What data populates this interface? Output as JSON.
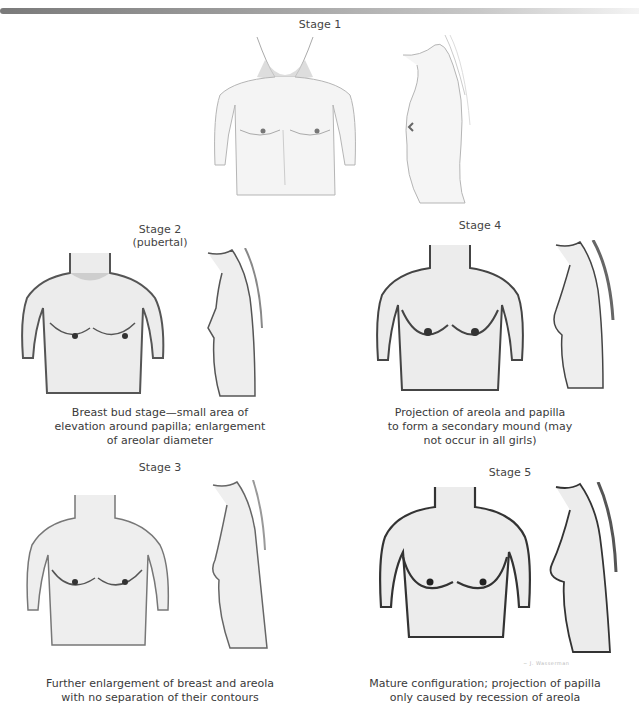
{
  "figure": {
    "header_bar": "gradient-rule",
    "stages": [
      {
        "id": "stage-1",
        "title": "Stage 1",
        "subtitle": "",
        "caption": ""
      },
      {
        "id": "stage-2",
        "title": "Stage 2",
        "subtitle": "(pubertal)",
        "caption_lines": [
          "Breast bud stage—small area of",
          "elevation around papilla; enlargement",
          "of areolar diameter"
        ]
      },
      {
        "id": "stage-3",
        "title": "Stage 3",
        "subtitle": "",
        "caption_lines": [
          "Further enlargement of breast and areola",
          "with no separation of their contours"
        ]
      },
      {
        "id": "stage-4",
        "title": "Stage 4",
        "subtitle": "",
        "caption_lines": [
          "Projection of areola and papilla",
          "to form a secondary mound (may",
          "not occur in all girls)"
        ]
      },
      {
        "id": "stage-5",
        "title": "Stage 5",
        "subtitle": "",
        "caption_lines": [
          "Mature configuration; projection of papilla",
          "only caused by recession of areola"
        ]
      }
    ],
    "artist_signature": "~ J. Wasserman"
  }
}
